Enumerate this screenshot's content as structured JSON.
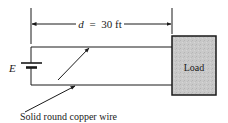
{
  "diagram": {
    "dimension": {
      "variable": "d",
      "equals": "=",
      "value": "30 ft"
    },
    "source_label": "E",
    "load_label": "Load",
    "wire_label": "Solid round copper wire",
    "colors": {
      "line": "#1a1a1a",
      "load_fill": "#c8c8c8",
      "background": "#ffffff"
    }
  }
}
